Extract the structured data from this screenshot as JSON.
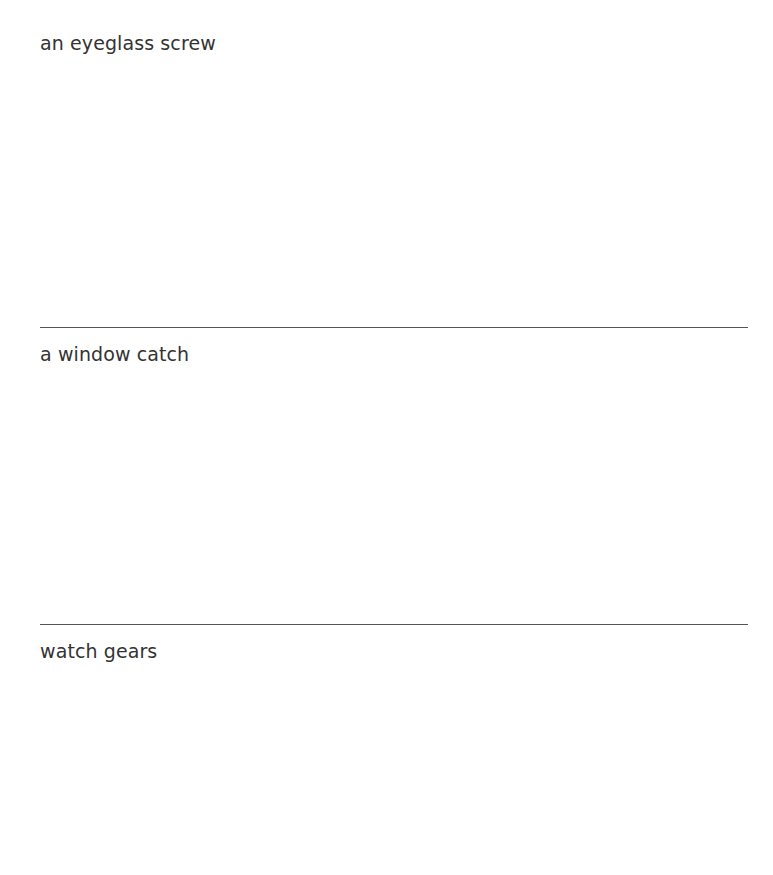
{
  "sections": [
    {
      "label": "an eyeglass screw"
    },
    {
      "label": "a window catch"
    },
    {
      "label": "watch gears"
    }
  ]
}
